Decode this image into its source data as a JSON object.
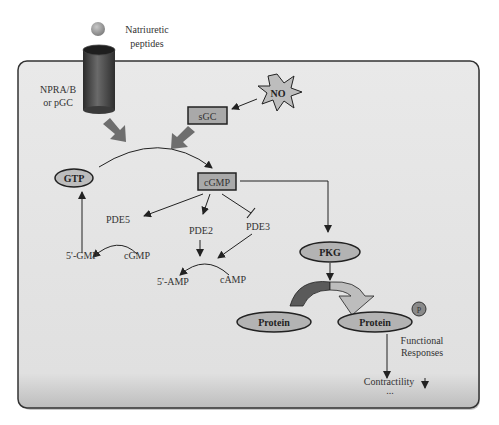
{
  "labels": {
    "ligand": "Natriuretic",
    "ligand_line2": "peptides",
    "receptor": "NPRA/B",
    "receptor_line2": "or pGC",
    "no": "NO",
    "sgc": "sGC",
    "gtp": "GTP",
    "cgmp_box": "cGMP",
    "pde5": "PDE5",
    "pde2": "PDE2",
    "pde3": "PDE3",
    "gmp5": "5'-GMP",
    "cgmp_substrate": "cGMP",
    "amp5": "5'-AMP",
    "camp": "cAMP",
    "pkg": "PKG",
    "protein": "Protein",
    "protein_p": "Protein",
    "phospho": "P",
    "functional": "Functional",
    "responses": "Responses",
    "contractility": "Contractility",
    "contractility_arrow": "↓",
    "ellipsis": "..."
  },
  "colors": {
    "cell_fill": "#e4e4e4",
    "cell_border": "#3a3a3a",
    "node_fill": "#b8b8b8",
    "node_border": "#2a2a2a",
    "thick_arrow": "#6e6e6e",
    "line": "#222222"
  }
}
